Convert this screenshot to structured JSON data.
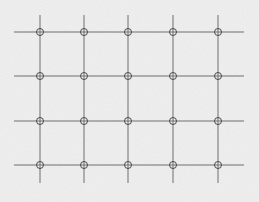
{
  "diagram": {
    "type": "grid-lattice",
    "background_color": "#f1f1f1",
    "line_color": "#6f6f6f",
    "node_color": "#4a4a4a",
    "columns_x": [
      40,
      84,
      128,
      173,
      218
    ],
    "rows_y": [
      32,
      76,
      121,
      165
    ],
    "h_line_extent": [
      14,
      244
    ],
    "v_line_extent": [
      15,
      183
    ],
    "node_radius": 3.5,
    "node_shape": "circle-with-crosshair",
    "rows": 4,
    "columns": 5
  }
}
